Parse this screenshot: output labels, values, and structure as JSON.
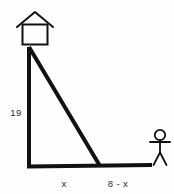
{
  "diagram": {
    "type": "right-triangle-geometry-figure",
    "background_color": "#fefefe",
    "stroke_color": "#111111",
    "text_color": "#2b2b2b",
    "labels": {
      "vertical_leg": "19",
      "base_left_segment": "x",
      "base_right_segment": "8 - x"
    },
    "icons": {
      "house": "house-icon",
      "person": "stick-figure-icon"
    },
    "geometry": {
      "apex": [
        29,
        47
      ],
      "bottom_left": [
        29,
        167
      ],
      "bottom_right": [
        100,
        166
      ],
      "ground_line_start": [
        27,
        167
      ],
      "ground_line_end": [
        152,
        165
      ]
    },
    "label_positions": {
      "vertical_leg": [
        16,
        113
      ],
      "base_left_segment": [
        62,
        184
      ],
      "base_right_segment": [
        118,
        184
      ]
    }
  }
}
